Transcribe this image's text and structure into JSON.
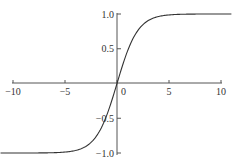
{
  "chart_data": {
    "type": "line",
    "title": "",
    "xlabel": "",
    "ylabel": "",
    "xlim": [
      -11.2,
      11
    ],
    "ylim": [
      -1.0,
      1.0
    ],
    "grid": false,
    "legend": null,
    "x_ticks": [
      "-10",
      "-5",
      "0",
      "5",
      "10"
    ],
    "y_ticks": [
      "1.0",
      "0.5",
      "-0.5",
      "-1.0"
    ],
    "series": [
      {
        "name": "tanh(x/2)",
        "x": [
          -11.2,
          -10,
          -8,
          -6,
          -5,
          -4,
          -3,
          -2,
          -1.5,
          -1,
          -0.5,
          0,
          0.5,
          1,
          1.5,
          2,
          3,
          4,
          5,
          6,
          8,
          10,
          11
        ],
        "values": [
          -1.0,
          -0.987,
          -0.999,
          -0.995,
          -0.987,
          -0.964,
          -0.905,
          -0.762,
          -0.635,
          -0.462,
          -0.245,
          0.0,
          0.245,
          0.462,
          0.635,
          0.762,
          0.905,
          0.964,
          0.987,
          0.995,
          0.999,
          1.0,
          1.0
        ]
      }
    ],
    "color": "#333333"
  }
}
